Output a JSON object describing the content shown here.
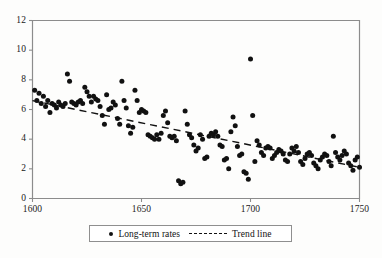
{
  "chart_data": {
    "type": "scatter",
    "title": "",
    "subtitle": "",
    "xlabel": "",
    "ylabel": "",
    "xlim": [
      1600,
      1750
    ],
    "ylim": [
      0,
      12
    ],
    "xticks": [
      1600,
      1650,
      1700,
      1750
    ],
    "yticks": [
      0,
      2,
      4,
      6,
      8,
      10,
      12
    ],
    "grid": false,
    "legend_position": "below-plot",
    "series": [
      {
        "name": "Long-term rates",
        "type": "scatter",
        "marker": "circle",
        "color": "#111111",
        "points": [
          [
            1601,
            7.3
          ],
          [
            1602,
            6.6
          ],
          [
            1603,
            7.1
          ],
          [
            1604,
            6.4
          ],
          [
            1605,
            6.9
          ],
          [
            1606,
            6.2
          ],
          [
            1607,
            6.6
          ],
          [
            1608,
            5.8
          ],
          [
            1609,
            6.4
          ],
          [
            1610,
            6.3
          ],
          [
            1611,
            6.1
          ],
          [
            1612,
            6.5
          ],
          [
            1613,
            6.3
          ],
          [
            1614,
            6.2
          ],
          [
            1615,
            6.4
          ],
          [
            1616,
            8.4
          ],
          [
            1617,
            7.9
          ],
          [
            1618,
            6.5
          ],
          [
            1619,
            6.4
          ],
          [
            1620,
            6.3
          ],
          [
            1621,
            6.5
          ],
          [
            1622,
            6.6
          ],
          [
            1623,
            6.4
          ],
          [
            1624,
            7.5
          ],
          [
            1625,
            7.2
          ],
          [
            1626,
            6.9
          ],
          [
            1627,
            6.5
          ],
          [
            1628,
            6.9
          ],
          [
            1629,
            6.7
          ],
          [
            1630,
            6.6
          ],
          [
            1631,
            6.2
          ],
          [
            1632,
            5.6
          ],
          [
            1633,
            5.0
          ],
          [
            1634,
            7.0
          ],
          [
            1635,
            6.0
          ],
          [
            1636,
            6.1
          ],
          [
            1637,
            6.5
          ],
          [
            1638,
            6.3
          ],
          [
            1639,
            5.4
          ],
          [
            1640,
            5.0
          ],
          [
            1641,
            7.9
          ],
          [
            1642,
            6.6
          ],
          [
            1643,
            6.1
          ],
          [
            1644,
            4.9
          ],
          [
            1645,
            4.4
          ],
          [
            1646,
            4.8
          ],
          [
            1647,
            7.3
          ],
          [
            1648,
            6.6
          ],
          [
            1649,
            5.8
          ],
          [
            1650,
            6.0
          ],
          [
            1651,
            5.9
          ],
          [
            1652,
            5.8
          ],
          [
            1653,
            4.3
          ],
          [
            1654,
            4.2
          ],
          [
            1655,
            4.1
          ],
          [
            1656,
            4.0
          ],
          [
            1657,
            4.3
          ],
          [
            1658,
            4.0
          ],
          [
            1659,
            4.4
          ],
          [
            1660,
            5.6
          ],
          [
            1661,
            5.9
          ],
          [
            1662,
            5.1
          ],
          [
            1663,
            4.2
          ],
          [
            1664,
            4.1
          ],
          [
            1665,
            4.2
          ],
          [
            1666,
            3.9
          ],
          [
            1667,
            1.2
          ],
          [
            1668,
            1.0
          ],
          [
            1669,
            1.1
          ],
          [
            1670,
            5.9
          ],
          [
            1671,
            5.0
          ],
          [
            1672,
            4.3
          ],
          [
            1673,
            4.1
          ],
          [
            1674,
            3.6
          ],
          [
            1675,
            3.2
          ],
          [
            1676,
            3.4
          ],
          [
            1677,
            4.3
          ],
          [
            1678,
            4.0
          ],
          [
            1679,
            2.7
          ],
          [
            1680,
            2.8
          ],
          [
            1681,
            4.2
          ],
          [
            1682,
            4.4
          ],
          [
            1683,
            4.3
          ],
          [
            1684,
            4.5
          ],
          [
            1685,
            4.2
          ],
          [
            1686,
            3.6
          ],
          [
            1687,
            3.5
          ],
          [
            1688,
            2.6
          ],
          [
            1689,
            2.7
          ],
          [
            1690,
            2.0
          ],
          [
            1691,
            4.5
          ],
          [
            1692,
            5.5
          ],
          [
            1693,
            4.9
          ],
          [
            1694,
            3.5
          ],
          [
            1695,
            2.9
          ],
          [
            1696,
            3.0
          ],
          [
            1697,
            1.8
          ],
          [
            1698,
            1.7
          ],
          [
            1699,
            1.3
          ],
          [
            1700,
            9.4
          ],
          [
            1701,
            5.6
          ],
          [
            1702,
            2.5
          ],
          [
            1703,
            3.9
          ],
          [
            1704,
            3.6
          ],
          [
            1705,
            3.1
          ],
          [
            1706,
            2.9
          ],
          [
            1707,
            3.4
          ],
          [
            1708,
            3.5
          ],
          [
            1709,
            3.4
          ],
          [
            1710,
            2.7
          ],
          [
            1711,
            2.9
          ],
          [
            1712,
            3.1
          ],
          [
            1713,
            3.3
          ],
          [
            1714,
            3.2
          ],
          [
            1715,
            3.0
          ],
          [
            1716,
            2.6
          ],
          [
            1717,
            2.5
          ],
          [
            1718,
            3.0
          ],
          [
            1719,
            3.4
          ],
          [
            1720,
            3.2
          ],
          [
            1721,
            3.5
          ],
          [
            1722,
            3.1
          ],
          [
            1723,
            2.5
          ],
          [
            1724,
            2.3
          ],
          [
            1725,
            2.7
          ],
          [
            1726,
            3.0
          ],
          [
            1727,
            3.1
          ],
          [
            1728,
            2.9
          ],
          [
            1729,
            2.4
          ],
          [
            1730,
            2.2
          ],
          [
            1731,
            2.0
          ],
          [
            1732,
            2.6
          ],
          [
            1733,
            2.8
          ],
          [
            1734,
            3.0
          ],
          [
            1735,
            2.9
          ],
          [
            1736,
            2.5
          ],
          [
            1737,
            2.2
          ],
          [
            1738,
            4.2
          ],
          [
            1739,
            3.1
          ],
          [
            1740,
            2.8
          ],
          [
            1741,
            2.6
          ],
          [
            1742,
            2.9
          ],
          [
            1743,
            3.2
          ],
          [
            1744,
            3.0
          ],
          [
            1745,
            2.4
          ],
          [
            1746,
            2.2
          ],
          [
            1747,
            1.9
          ],
          [
            1748,
            2.6
          ],
          [
            1749,
            2.8
          ],
          [
            1750,
            2.1
          ]
        ]
      },
      {
        "name": "Trend line",
        "type": "line",
        "style": "dashed",
        "color": "#111111",
        "endpoints": [
          [
            1600,
            6.6
          ],
          [
            1750,
            2.1
          ]
        ]
      }
    ]
  },
  "axes": {
    "y_tick_labels": [
      "12",
      "10",
      "8",
      "6",
      "4",
      "2",
      "0"
    ],
    "x_tick_labels": [
      "1600",
      "1650",
      "1700",
      "1750"
    ]
  },
  "legend": {
    "scatter_label": "Long-term rates",
    "trend_label": "Trend line",
    "marker_icon": "filled-circle-marker",
    "line_icon": "dashed-line-sample"
  },
  "colors": {
    "marker": "#111111",
    "trend": "#111111",
    "axis": "#8c8c8c",
    "text": "#1a1a1a",
    "background": "#fdfdfc"
  }
}
